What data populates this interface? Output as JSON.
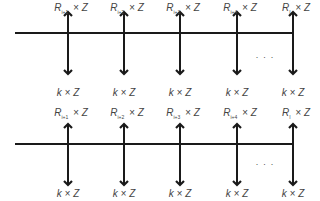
{
  "diagram": {
    "colors": {
      "line": "#1a1a1a",
      "text": "#444444"
    },
    "rows": [
      {
        "name": "row-1",
        "line_y": 33,
        "arrow_type": "double",
        "top_labels": [
          {
            "base": "R",
            "sub": "i+1",
            "suffix": " × Z"
          },
          {
            "base": "R",
            "sub": "i+2",
            "suffix": " × Z"
          },
          {
            "base": "R",
            "sub": "i+3",
            "suffix": " × Z"
          },
          {
            "base": "R",
            "sub": "i+4",
            "suffix": " × Z"
          },
          {
            "base": "R",
            "sub": "I",
            "suffix": " × Z"
          }
        ],
        "bottom_labels": [
          "k × Z",
          "k × Z",
          "k × Z",
          "k × Z",
          "k × Z"
        ],
        "ellipsis": "· · ·"
      },
      {
        "name": "row-2",
        "line_y": 144,
        "arrow_type": "double",
        "top_labels": [
          {
            "base": "R",
            "sub": "i+1",
            "suffix": " × Z"
          },
          {
            "base": "R",
            "sub": "i+2",
            "suffix": " × Z"
          },
          {
            "base": "R",
            "sub": "i+3",
            "suffix": " × Z"
          },
          {
            "base": "R",
            "sub": "i+4",
            "suffix": " × Z"
          },
          {
            "base": "R",
            "sub": "I",
            "suffix": " × Z"
          }
        ],
        "bottom_labels": [
          "k × Z",
          "k × Z",
          "k × Z",
          "k × Z",
          "k × Z"
        ],
        "ellipsis": "· · ·"
      }
    ],
    "arrow_x": [
      68,
      124,
      180,
      237,
      293
    ]
  }
}
